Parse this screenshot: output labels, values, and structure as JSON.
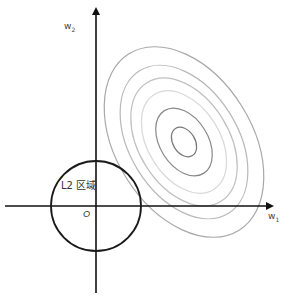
{
  "diagram": {
    "type": "L2 regularization geometric illustration",
    "axes": {
      "x_label": "w",
      "x_label_sub": "1",
      "y_label": "w",
      "y_label_sub": "2",
      "origin_label": "O"
    },
    "constraint_region": {
      "label": "L2 区域",
      "shape": "circle",
      "center": [
        96,
        206
      ],
      "radius": 45,
      "stroke": "#1a1a1a"
    },
    "loss_contours": {
      "shape": "ellipse",
      "center": [
        184,
        142
      ],
      "rotation_deg": -32,
      "rings": [
        {
          "rx": 11,
          "ry": 16,
          "stroke": "#777777"
        },
        {
          "rx": 24,
          "ry": 37,
          "stroke": "#888888"
        },
        {
          "rx": 36,
          "ry": 56,
          "stroke": "#d8d8d8"
        },
        {
          "rx": 45,
          "ry": 70,
          "stroke": "#c0c0c0"
        },
        {
          "rx": 54,
          "ry": 84,
          "stroke": "#b8b8b8"
        },
        {
          "rx": 68,
          "ry": 104,
          "stroke": "#a8a8a8"
        }
      ]
    },
    "colors": {
      "axis": "#111111",
      "background": "#ffffff"
    }
  }
}
